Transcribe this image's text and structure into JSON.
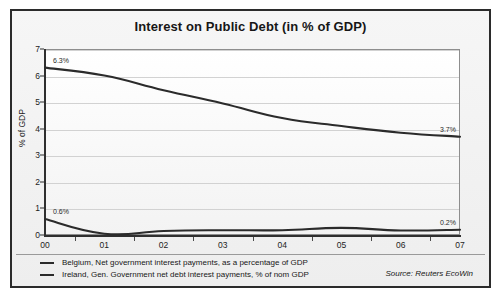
{
  "chart_data": {
    "type": "line",
    "title": "Interest on Public Debt (in % of GDP)",
    "xlabel": "",
    "ylabel": "% of GDP",
    "categories": [
      "00",
      "01",
      "02",
      "03",
      "04",
      "05",
      "06",
      "07"
    ],
    "ylim": [
      0,
      7
    ],
    "yticks": [
      0,
      1,
      2,
      3,
      4,
      5,
      6,
      7
    ],
    "grid": true,
    "legend_position": "bottom-left",
    "series": [
      {
        "name": "Belgium, Net government interest payments, as a percentage of GDP",
        "color": "#2b2b2b",
        "values": [
          6.3,
          6.0,
          5.45,
          4.95,
          4.4,
          4.1,
          3.85,
          3.7
        ],
        "labels": [
          {
            "category": "00",
            "value": 6.3,
            "text": "6.3%"
          },
          {
            "category": "07",
            "value": 3.7,
            "text": "3.7%"
          }
        ]
      },
      {
        "name": "Ireland, Gen. Government net debt interest payments, % of nom GDP",
        "color": "#2b2b2b",
        "values": [
          0.6,
          0.05,
          0.15,
          0.18,
          0.18,
          0.27,
          0.17,
          0.2
        ],
        "labels": [
          {
            "category": "00",
            "value": 0.6,
            "text": "0.6%"
          },
          {
            "category": "07",
            "value": 0.2,
            "text": "0.2%"
          }
        ]
      }
    ],
    "source": "Source: Reuters EcoWin"
  }
}
